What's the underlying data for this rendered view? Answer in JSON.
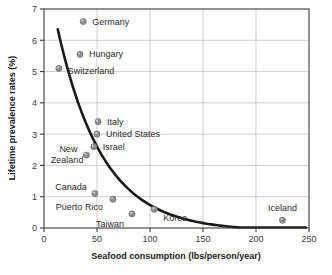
{
  "chart_data": {
    "type": "scatter",
    "title": "",
    "xlabel": "Seafood consumption (lbs/person/year)",
    "ylabel": "Lifetime prevalence rates (%)",
    "xlim": [
      0,
      250
    ],
    "ylim": [
      0,
      7
    ],
    "xticks": [
      "0",
      "50",
      "100",
      "150",
      "200",
      "250"
    ],
    "yticks": [
      "0",
      "1",
      "2",
      "3",
      "4",
      "5",
      "6",
      "7"
    ],
    "xtick_values": [
      0,
      50,
      100,
      150,
      200,
      250
    ],
    "ytick_values": [
      0,
      1,
      2,
      3,
      4,
      5,
      6,
      7
    ],
    "grid": true,
    "legend": "none",
    "points": [
      {
        "label": "Germany",
        "x": 37,
        "y": 6.6,
        "label_dx": 9,
        "label_dy": 3,
        "anchor": "start"
      },
      {
        "label": "Hungary",
        "x": 34,
        "y": 5.55,
        "label_dx": 9,
        "label_dy": 3,
        "anchor": "start"
      },
      {
        "label": "Switzerland",
        "x": 14,
        "y": 5.1,
        "label_dx": 9,
        "label_dy": 6,
        "anchor": "start"
      },
      {
        "label": "Italy",
        "x": 51,
        "y": 3.4,
        "label_dx": 9,
        "label_dy": 3,
        "anchor": "start"
      },
      {
        "label": "United States",
        "x": 50,
        "y": 3.0,
        "label_dx": 9,
        "label_dy": 3,
        "anchor": "start"
      },
      {
        "label": "Israel",
        "x": 47,
        "y": 2.6,
        "label_dx": 9,
        "label_dy": 3,
        "anchor": "start"
      },
      {
        "label": "New Zealand",
        "x": 40,
        "y": 2.33,
        "label_dx": -9,
        "label_dy": 0,
        "anchor": "end",
        "two_line": true,
        "line1": "New",
        "line2": "Zealand"
      },
      {
        "label": "Canada",
        "x": 48,
        "y": 1.1,
        "label_dx": -8,
        "label_dy": -4,
        "anchor": "end"
      },
      {
        "label": "Puerto Rico",
        "x": 65,
        "y": 0.92,
        "label_dx": -10,
        "label_dy": 11,
        "anchor": "end"
      },
      {
        "label": "Taiwan",
        "x": 83,
        "y": 0.45,
        "label_dx": -8,
        "label_dy": 13,
        "anchor": "end"
      },
      {
        "label": "Korea",
        "x": 104,
        "y": 0.6,
        "label_dx": 9,
        "label_dy": 12,
        "anchor": "start"
      },
      {
        "label": "Iceland",
        "x": 225,
        "y": 0.25,
        "label_dx": 0,
        "label_dy": -9,
        "anchor": "middle"
      }
    ],
    "trendline": {
      "description": "exponential decay fit curve",
      "x_start": 13,
      "x_end": 247,
      "y_start": 6.45,
      "y_end": 0.03
    }
  }
}
